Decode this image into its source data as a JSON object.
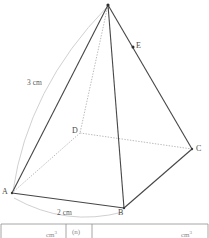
{
  "figure": {
    "kind": "square-based-pyramid-diagram",
    "vertices": [
      {
        "id": "apex",
        "label": "",
        "x": 108,
        "y": 5
      },
      {
        "id": "A",
        "label": "A",
        "x": 12,
        "y": 193
      },
      {
        "id": "B",
        "label": "B",
        "x": 124,
        "y": 208
      },
      {
        "id": "C",
        "label": "C",
        "x": 192,
        "y": 149
      },
      {
        "id": "D",
        "label": "D",
        "x": 80,
        "y": 133
      },
      {
        "id": "E",
        "label": "E",
        "x": 133,
        "y": 47
      }
    ],
    "solid_edges": [
      {
        "from": "apex",
        "to": "A"
      },
      {
        "from": "apex",
        "to": "B"
      },
      {
        "from": "apex",
        "to": "C"
      },
      {
        "from": "A",
        "to": "B"
      },
      {
        "from": "B",
        "to": "C"
      }
    ],
    "hidden_edges": [
      {
        "from": "apex",
        "to": "D"
      },
      {
        "from": "A",
        "to": "D"
      },
      {
        "from": "D",
        "to": "C"
      }
    ],
    "point_markers": [
      "apex",
      "E"
    ],
    "measurements": [
      {
        "id": "slant-height",
        "value": "3 cm",
        "from": "A",
        "to": "apex"
      },
      {
        "id": "base-edge",
        "value": "2 cm",
        "from": "A",
        "to": "B"
      }
    ],
    "colors": {
      "edge": "#444444",
      "hidden_edge": "#9a9a9a",
      "measure_arc": "#bcbcbc",
      "label": "#4a4a4a",
      "table_rule": "#8f8f8f",
      "background": "#ffffff"
    }
  },
  "table": {
    "visible_fragment": true,
    "cells": [
      "cm",
      "(n)",
      "cm"
    ],
    "cell_superscripts": [
      "3",
      "",
      "3"
    ],
    "column_dividers_x": [
      66,
      92,
      1,
      208
    ]
  }
}
